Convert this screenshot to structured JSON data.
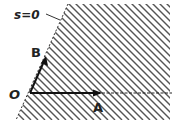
{
  "diagram": {
    "boundary_label": "s=0",
    "origin_label": "O",
    "vector_a_label": "A",
    "vector_b_label": "B",
    "region": "hatched half-plane",
    "colors": {
      "background": "#ffffff",
      "ink": "#222222",
      "hatch": "#555555"
    }
  }
}
